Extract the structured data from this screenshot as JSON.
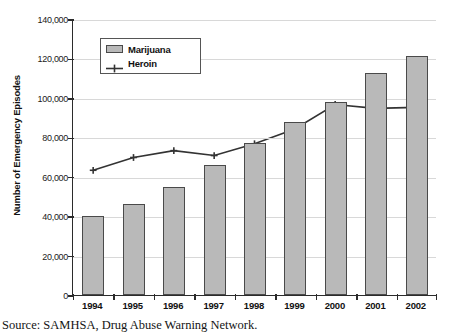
{
  "chart_data": {
    "type": "bar",
    "title": "",
    "xlabel": "",
    "ylabel": "Number of Emergency Episodes",
    "categories": [
      "1994",
      "1995",
      "1996",
      "1997",
      "1998",
      "1999",
      "2000",
      "2001",
      "2002"
    ],
    "series": [
      {
        "name": "Marijuana",
        "type": "bar",
        "color": "#b9b9b9",
        "values": [
          40000,
          46000,
          55000,
          66000,
          77000,
          88000,
          98000,
          112500,
          121000
        ]
      },
      {
        "name": "Heroin",
        "type": "line",
        "color": "#333333",
        "values": [
          63500,
          70000,
          73500,
          71000,
          77000,
          84500,
          97000,
          95000,
          95500
        ]
      }
    ],
    "ylim": [
      0,
      140000
    ],
    "ytick_values": [
      0,
      20000,
      40000,
      60000,
      80000,
      100000,
      120000,
      140000
    ],
    "ytick_labels": [
      "0",
      "20,000",
      "40,000",
      "60,000",
      "80,000",
      "100,000",
      "120,000",
      "140,000"
    ],
    "grid": true,
    "legend_position": "upper-left-inside"
  },
  "legend": {
    "items": [
      {
        "label": "Marijuana",
        "marker": "bar-swatch"
      },
      {
        "label": "Heroin",
        "marker": "line-plus-marker"
      }
    ]
  },
  "footer": {
    "source": "Source: SAMHSA, Drug Abuse Warning Network."
  }
}
